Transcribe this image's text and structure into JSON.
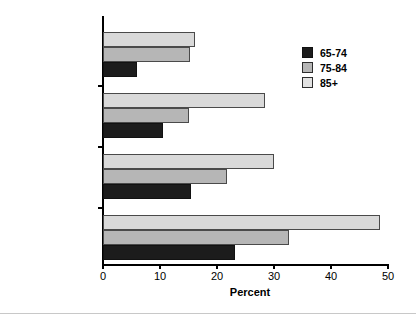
{
  "chart_data": {
    "type": "bar",
    "orientation": "horizontal",
    "title": "",
    "xlabel": "Percent",
    "ylabel": "",
    "xlim": [
      0,
      50
    ],
    "xticks": [
      0,
      10,
      20,
      30,
      40,
      50
    ],
    "xtick_labels": [
      "0",
      "10",
      "20",
      "30",
      "40",
      "50"
    ],
    "grid": false,
    "legend_position": "upper right",
    "categories": [
      "Use hearing aid",
      "Deafness",
      "Trouble hearing",
      "Impaired"
    ],
    "series": [
      {
        "name": "65-74",
        "color": "#1c1c1c",
        "values": [
          6.0,
          10.5,
          15.5,
          23.2
        ]
      },
      {
        "name": "75-84",
        "color": "#b6b6b6",
        "values": [
          15.2,
          15.1,
          21.8,
          32.7
        ]
      },
      {
        "name": "85+",
        "color": "#d9d9d9",
        "values": [
          16.2,
          28.4,
          30.0,
          48.6
        ]
      }
    ]
  },
  "legend": {
    "entries": [
      {
        "label": "65-74"
      },
      {
        "label": "75-84"
      },
      {
        "label": "85+"
      }
    ]
  },
  "axis": {
    "x_title": "Percent"
  }
}
